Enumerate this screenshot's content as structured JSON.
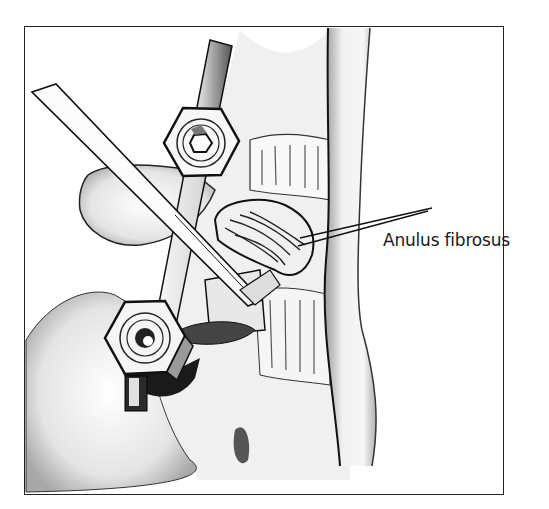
{
  "figure": {
    "type": "surgical-illustration",
    "labels": [
      {
        "text": "Anulus fibrosus",
        "target": "disc-anulus"
      }
    ],
    "colors": {
      "ink": "#1a1a1a",
      "shade": "#8a8a8a",
      "light_shade": "#cfcfcf",
      "background": "#ffffff"
    },
    "components": [
      {
        "name": "upper-hex-nut",
        "icon": "hex-nut"
      },
      {
        "name": "lower-hex-nut",
        "icon": "hex-nut"
      },
      {
        "name": "connecting-rod",
        "icon": "rod"
      },
      {
        "name": "surgical-instrument",
        "icon": "forceps"
      },
      {
        "name": "intervertebral-disc",
        "icon": "disc"
      },
      {
        "name": "vertebral-column",
        "icon": "spine"
      }
    ]
  }
}
